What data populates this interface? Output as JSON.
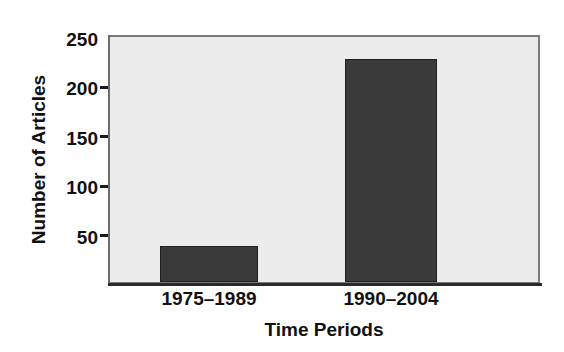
{
  "chart_data": {
    "type": "bar",
    "title": "",
    "xlabel": "Time Periods",
    "ylabel": "Number of Articles",
    "categories": [
      "1975–1989",
      "1990–2004"
    ],
    "values": [
      37,
      228
    ],
    "series": [
      {
        "name": "Number of Articles",
        "values": [
          37,
          228
        ]
      }
    ],
    "ylim": [
      0,
      250
    ],
    "yticks": [
      50,
      100,
      150,
      200,
      250
    ],
    "ytick_labels": [
      "50",
      "100",
      "150",
      "200",
      "250"
    ],
    "grid": false,
    "legend": null,
    "legend_position": "none",
    "annotations": [],
    "colors": {
      "bar_fill": "#3a3a3a",
      "bar_edge": "#202020",
      "plot_background": "#ececec",
      "figure_background": "#ffffff",
      "axis_line": "#2a2a2a",
      "frame": "#7a7a7a",
      "text": "#111111"
    }
  }
}
